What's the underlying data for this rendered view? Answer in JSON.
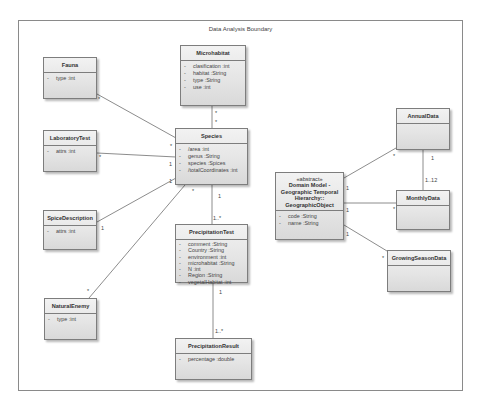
{
  "boundary": {
    "title": "Data Analysis Boundary"
  },
  "classes": {
    "fauna": {
      "name": "Fauna",
      "attributes": [
        {
          "vis": "-",
          "text": "type :int"
        }
      ]
    },
    "microhabitat": {
      "name": "Microhabitat",
      "attributes": [
        {
          "vis": "-",
          "text": "clasification :int"
        },
        {
          "vis": "-",
          "text": "habitat :String"
        },
        {
          "vis": "-",
          "text": "type :String"
        },
        {
          "vis": "-",
          "text": "use :int"
        }
      ]
    },
    "species": {
      "name": "Species",
      "attributes": [
        {
          "vis": "-",
          "text": "/area :int"
        },
        {
          "vis": "-",
          "text": "genus :String"
        },
        {
          "vis": "-",
          "text": "species :Spices"
        },
        {
          "vis": "-",
          "text": "/totalCoordinates :int"
        }
      ]
    },
    "laboratory_test": {
      "name": "LaboratoryTest",
      "attributes": [
        {
          "vis": "-",
          "text": "attrs :int"
        }
      ]
    },
    "spice_description": {
      "name": "SpiceDescription",
      "attributes": [
        {
          "vis": "-",
          "text": "attrs :int"
        }
      ]
    },
    "natural_enemy": {
      "name": "NaturalEnemy",
      "attributes": [
        {
          "vis": "-",
          "text": "type :int"
        }
      ]
    },
    "precipitation_test": {
      "name": "PrecipitationTest",
      "attributes": [
        {
          "vis": "-",
          "text": "comment :String"
        },
        {
          "vis": "-",
          "text": "Country :String"
        },
        {
          "vis": "-",
          "text": "environment :int"
        },
        {
          "vis": "-",
          "text": "microhabitat :String"
        },
        {
          "vis": "-",
          "text": "N :int"
        },
        {
          "vis": "-",
          "text": "Region :String"
        },
        {
          "vis": "-",
          "text": "vegetalHabitat :int"
        }
      ]
    },
    "precipitation_result": {
      "name": "PrecipitationResult",
      "attributes": [
        {
          "vis": "-",
          "text": "percentage :double"
        }
      ]
    },
    "geographic_object": {
      "stereotype": "«abstract»",
      "name_lines": [
        "Domain Model -",
        "Geographic Temporal",
        "Hierarchy::",
        "GeographicObject"
      ],
      "attributes": [
        {
          "vis": "-",
          "text": "code :String"
        },
        {
          "vis": "-",
          "text": "name :String"
        }
      ]
    },
    "annual_data": {
      "name": "AnnualData",
      "attributes": []
    },
    "monthly_data": {
      "name": "MonthlyData",
      "attributes": []
    },
    "growing_season_data": {
      "name": "GrowingSeasonData",
      "attributes": []
    }
  },
  "multiplicities": {
    "fauna_end": "*",
    "species_fauna_end": "*",
    "micro_end": "*",
    "species_micro_end": "*",
    "lab_end": "*",
    "species_lab_end": "1",
    "spice_end": "1",
    "species_spice_end": "1",
    "enemy_end": "*",
    "species_enemy_end": "*",
    "species_precip_end": "1",
    "precip_species_end": "1..*",
    "precip_result_end_top": "1",
    "result_end": "1..*",
    "geo_annual_end": "1",
    "annual_geo_end": "*",
    "geo_monthly_end": "1",
    "monthly_geo_end": "*",
    "geo_growing_end": "1",
    "growing_geo_end": "*",
    "annual_monthly_end": "1",
    "monthly_annual_end": "1..12"
  },
  "colors": {
    "line": "#6e6e6e",
    "class_border": "#7d7d7d",
    "class_fill": "#e6e6e6"
  }
}
